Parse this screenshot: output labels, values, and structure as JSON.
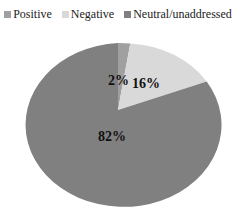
{
  "chart_data": {
    "type": "pie",
    "title": "",
    "categories": [
      "Positive",
      "Negative",
      "Neutral/unaddressed"
    ],
    "values": [
      2,
      16,
      82
    ],
    "labels": [
      "2%",
      "16%",
      "82%"
    ],
    "colors": [
      "#a0a0a0",
      "#d9d9d9",
      "#808080"
    ],
    "legend_position": "top"
  },
  "legend": {
    "items": [
      {
        "label": "Positive",
        "color": "#a0a0a0"
      },
      {
        "label": "Negative",
        "color": "#d9d9d9"
      },
      {
        "label": "Neutral/unaddressed",
        "color": "#808080"
      }
    ]
  }
}
